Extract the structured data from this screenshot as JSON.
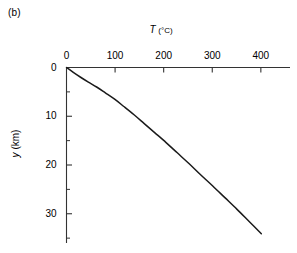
{
  "figure": {
    "panel_label": "(b)",
    "background_color": "#ffffff",
    "line_color": "#1a1a1a",
    "axis_color": "#333333"
  },
  "chart_data": {
    "type": "line",
    "title": "",
    "panel": "(b)",
    "xlabel": "T (°C)",
    "xlabel_symbol": "T",
    "xlabel_units": "(°C)",
    "ylabel": "y (km)",
    "ylabel_symbol": "y",
    "ylabel_units": "(km)",
    "xlabel_position": "top",
    "ylabel_position": "left",
    "x_axis_position": "top",
    "y_axis_direction": "inverted",
    "grid": false,
    "legend": false,
    "xlim": [
      0,
      460
    ],
    "ylim": [
      36,
      0
    ],
    "xticks": [
      0,
      100,
      200,
      300,
      400
    ],
    "xticklabels": [
      "0",
      "100",
      "200",
      "300",
      "400"
    ],
    "xminorticks": [],
    "yticks": [
      0,
      10,
      20,
      30
    ],
    "yticklabels": [
      "0",
      "10",
      "20",
      "30"
    ],
    "yminorticks": [
      5,
      15,
      25,
      35
    ],
    "series": [
      {
        "name": "geotherm",
        "x": [
          0,
          14,
          29,
          45,
          62,
          80,
          99,
          118,
          139,
          160,
          182,
          205,
          228,
          252,
          276,
          301,
          326,
          351,
          376,
          401
        ],
        "y": [
          0,
          1,
          2,
          3,
          4,
          5.2,
          6.5,
          8,
          9.7,
          11.5,
          13.4,
          15.4,
          17.5,
          19.7,
          22,
          24.3,
          26.7,
          29.1,
          31.6,
          34.1
        ]
      }
    ]
  }
}
